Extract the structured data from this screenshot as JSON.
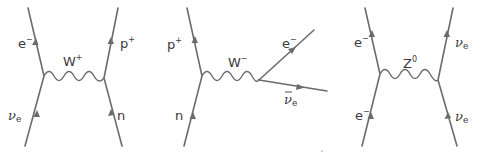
{
  "colors": {
    "line": "#6b6b6b",
    "text": "#3a3a3a",
    "background": "#ffffff"
  },
  "diagrams": [
    {
      "id": "w-plus",
      "boson": {
        "base": "W",
        "sup": "+"
      },
      "particles": {
        "top_left": {
          "base": "e",
          "sup": "−"
        },
        "top_right": {
          "base": "p",
          "sup": "+"
        },
        "bottom_left": {
          "base": "ν",
          "sub": "e"
        },
        "bottom_right": {
          "base": "n"
        }
      }
    },
    {
      "id": "w-minus",
      "boson": {
        "base": "W",
        "sup": "−"
      },
      "particles": {
        "top_left": {
          "base": "p",
          "sup": "+"
        },
        "bottom_left": {
          "base": "n"
        },
        "out_upper": {
          "base": "e",
          "sup": "−"
        },
        "out_lower": {
          "base": "ν",
          "bar": "‾",
          "sub": "e"
        }
      }
    },
    {
      "id": "z-zero",
      "boson": {
        "base": "Z",
        "sup": "0"
      },
      "particles": {
        "top_left": {
          "base": "e",
          "sup": "−"
        },
        "top_right": {
          "base": "ν",
          "sub": "e"
        },
        "bottom_left": {
          "base": "e",
          "sup": "−"
        },
        "bottom_right": {
          "base": "ν",
          "sub": "e"
        }
      }
    }
  ]
}
